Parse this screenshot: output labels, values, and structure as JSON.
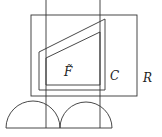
{
  "diagram": {
    "labels": {
      "F": "F̃",
      "F_base": "F",
      "C": "C",
      "R": "R"
    },
    "colors": {
      "stroke": "#333333",
      "text": "#222222",
      "background": "#ffffff"
    },
    "shapes": {
      "rect_R": {
        "x": 31,
        "y": 15,
        "w": 106,
        "h": 81
      },
      "vertical_line_left": {
        "x": 46,
        "y1": 0,
        "y2": 128
      },
      "vertical_line_right": {
        "x": 100,
        "y1": 0,
        "y2": 128
      },
      "polygon_C": "39,52 105,19 105,90 39,90",
      "polygon_F": "46,58 100,32 100,85 46,85",
      "semicircle_left": {
        "cx": 33,
        "cy": 128,
        "r": 27
      },
      "semicircle_right": {
        "cx": 86,
        "cy": 128,
        "r": 26
      },
      "baseline": {
        "x1": 6,
        "x2": 112,
        "y": 128
      }
    }
  }
}
